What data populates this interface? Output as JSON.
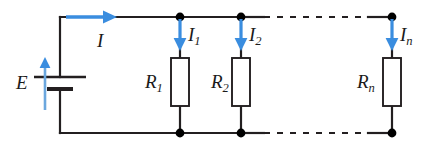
{
  "figure": {
    "name": "parallel-resistor-circuit",
    "colors": {
      "wire": "#231f20",
      "arrow_blue": "#3a8ddf",
      "node": "#000000",
      "resistor_fill": "#ffffff",
      "background": "#ffffff"
    }
  },
  "labels": {
    "source": "E",
    "total_current": "I",
    "branch_currents": [
      {
        "base": "I",
        "sub": "1"
      },
      {
        "base": "I",
        "sub": "2"
      },
      {
        "base": "I",
        "sub": "n"
      }
    ],
    "resistors": [
      {
        "base": "R",
        "sub": "1"
      },
      {
        "base": "R",
        "sub": "2"
      },
      {
        "base": "R",
        "sub": "n"
      }
    ]
  },
  "geometry": {
    "top_rail_y": 17,
    "bottom_rail_y": 133,
    "left_rail_x": 60,
    "branch_x": [
      180,
      241,
      392
    ],
    "resistor_box": {
      "width": 18,
      "top": 58,
      "height": 48
    },
    "battery": {
      "x": 60,
      "long_plate_y": 77,
      "short_plate_y": 89,
      "long_plate_half_width": 26,
      "short_plate_half_width": 13
    },
    "dashes": {
      "top": {
        "x1": 262,
        "x2": 370,
        "y": 17
      },
      "bottom": {
        "x1": 262,
        "x2": 370,
        "y": 133
      }
    }
  }
}
